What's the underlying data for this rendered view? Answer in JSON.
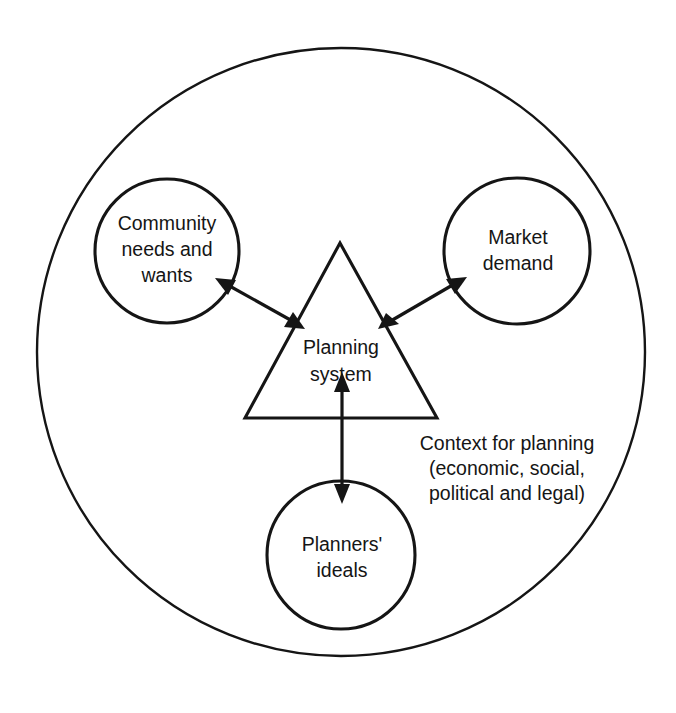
{
  "figure": {
    "background_color": "#ffffff",
    "line_color": "#151515"
  },
  "diagram": {
    "type": "concept-diagram",
    "outer_boundary": {
      "shape": "circle",
      "label_line_1": "Context for planning",
      "label_line_2": "(economic, social,",
      "label_line_3": "political and legal)"
    },
    "center_node": {
      "shape": "triangle",
      "label_line_1": "Planning",
      "label_line_2": "system"
    },
    "nodes": [
      {
        "id": "community",
        "shape": "circle",
        "position": "top-left",
        "label_line_1": "Community",
        "label_line_2": "needs and",
        "label_line_3": "wants"
      },
      {
        "id": "market",
        "shape": "circle",
        "position": "top-right",
        "label_line_1": "Market",
        "label_line_2": "demand",
        "label_line_3": ""
      },
      {
        "id": "planners",
        "shape": "circle",
        "position": "bottom-center",
        "label_line_1": "Planners'",
        "label_line_2": "ideals",
        "label_line_3": ""
      }
    ],
    "connectors": [
      {
        "id": "community-planning",
        "from": "community",
        "to": "center_node",
        "direction": "bidirectional"
      },
      {
        "id": "market-planning",
        "from": "market",
        "to": "center_node",
        "direction": "bidirectional"
      },
      {
        "id": "planners-planning",
        "from": "planners",
        "to": "center_node",
        "direction": "bidirectional"
      }
    ]
  }
}
